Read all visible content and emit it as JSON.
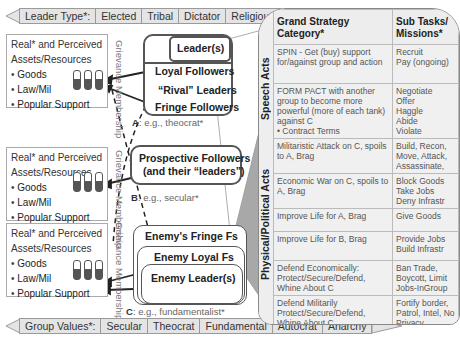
{
  "leader_type_banner": {
    "label": "Leader Type*:",
    "items": [
      "Elected",
      "Tribal",
      "Dictator",
      "Religious"
    ]
  },
  "group_values_banner": {
    "label": "Group Values*:",
    "items": [
      "Secular",
      "Theocrat",
      "Fundamental",
      "Autocrat",
      "Anarchy"
    ]
  },
  "assets": {
    "title_line1": "Real* and Perceived",
    "title_line2": "Assets/Resources",
    "items": [
      "Goods",
      "Law/Mil",
      "Popular Support"
    ]
  },
  "grievance_label": "Grievance Membership",
  "group_a": {
    "leaders": "Leader(s)",
    "loyal": "Loyal Followers",
    "rival": "“Rival” Leaders",
    "fringe": "Fringe Followers",
    "caption_key": "A",
    "caption": ": e.g., theocrat*"
  },
  "group_b": {
    "line1": "Prospective Followers",
    "line2": "(and their “leaders”)",
    "caption_key": "B",
    "caption": ": e.g., secular*"
  },
  "group_c": {
    "fringe": "Enemy's Fringe Fs",
    "loyal": "Enemy Loyal Fs",
    "leaders": "Enemy Leader(s)",
    "caption_key": "C",
    "caption": ": e.g., fundamentalist*"
  },
  "strategy_table": {
    "headers": [
      "Grand Strategy Category*",
      "Sub Tasks/ Missions*"
    ],
    "side_labels": [
      "Speech Acts",
      "Physical/Political Acts"
    ],
    "rows": [
      {
        "category": "SPIN - Get (buy) support for/against group and action",
        "tasks": "Recruit\nPay (ongoing)"
      },
      {
        "category": "FORM PACT with another group to become more powerful (more of each tank) against C\n• Contract Terms",
        "tasks": "Negotiate\nOffer\nHaggle\nAbide\nViolate"
      },
      {
        "category": "Militaristic Attack on C, spoils to A, Brag",
        "tasks": "Build, Recon, Move, Attack, Assassinate,"
      },
      {
        "category": "Economic War on C, spoils to A, Brag",
        "tasks": "Block Goods\nTake Jobs\nDeny Infrastr"
      },
      {
        "category": "Improve Life for A, Brag",
        "tasks": "Give Goods"
      },
      {
        "category": "Improve Life for B, Brag",
        "tasks": "Provide Jobs\nBuild Infrastr"
      },
      {
        "category": "Defend Economically: Protect/Secure/Defend, Whine About C",
        "tasks": "Ban Trade, Boycott, Limit Jobs-InGroup"
      },
      {
        "category": "Defend Militarily Protect/Secure/Defend, Whine About C",
        "tasks": "Fortify border, Patrol, Intel, No Privacy"
      }
    ]
  },
  "colors": {
    "banner_fill": "#e4e4e4",
    "frame": "#555555",
    "tank_fill": "#555555",
    "callout_fill": "#a8a8a8"
  }
}
